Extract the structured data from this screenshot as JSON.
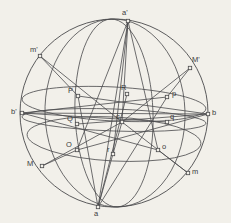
{
  "figure": {
    "background_color": "#f2f0ea",
    "ink_color": "#4a4a4c",
    "label_color": "#3a3a3c",
    "width": 231,
    "height": 223,
    "outer_circle": {
      "cx": 114,
      "cy": 113,
      "r": 94
    },
    "caption_partial": ""
  },
  "points": [
    {
      "id": "a-prime",
      "label": "a'",
      "x": 128,
      "y": 21,
      "lx": 122,
      "ly": 9,
      "marker": true
    },
    {
      "id": "a",
      "label": "a",
      "x": 98,
      "y": 207,
      "lx": 94,
      "ly": 210,
      "marker": true
    },
    {
      "id": "b-prime",
      "label": "b'",
      "x": 22,
      "y": 113,
      "lx": 11,
      "ly": 108,
      "marker": true
    },
    {
      "id": "b",
      "label": "b",
      "x": 208,
      "y": 114,
      "lx": 212,
      "ly": 109,
      "marker": true
    },
    {
      "id": "c",
      "label": "c",
      "x": 122,
      "y": 122,
      "lx": 116,
      "ly": 113,
      "marker": true
    },
    {
      "id": "m-prime",
      "label": "m'",
      "x": 40,
      "y": 56,
      "lx": 30,
      "ly": 46,
      "marker": true
    },
    {
      "id": "M-prime",
      "label": "M'",
      "x": 190,
      "y": 68,
      "lx": 192,
      "ly": 56,
      "marker": true
    },
    {
      "id": "M",
      "label": "M",
      "x": 42,
      "y": 166,
      "lx": 27,
      "ly": 160,
      "marker": true
    },
    {
      "id": "m",
      "label": "m",
      "x": 188,
      "y": 173,
      "lx": 192,
      "ly": 168,
      "marker": true
    },
    {
      "id": "P",
      "label": "P",
      "x": 78,
      "y": 96,
      "lx": 68,
      "ly": 87,
      "marker": true
    },
    {
      "id": "Q",
      "label": "Q",
      "x": 77,
      "y": 124,
      "lx": 67,
      "ly": 115,
      "marker": true
    },
    {
      "id": "O",
      "label": "O",
      "x": 77,
      "y": 150,
      "lx": 66,
      "ly": 141,
      "marker": true
    },
    {
      "id": "R",
      "label": "R",
      "x": 127,
      "y": 94,
      "lx": 121,
      "ly": 84,
      "marker": true
    },
    {
      "id": "r",
      "label": "r",
      "x": 113,
      "y": 154,
      "lx": 107,
      "ly": 146,
      "marker": true
    },
    {
      "id": "p",
      "label": "p",
      "x": 167,
      "y": 97,
      "lx": 172,
      "ly": 90,
      "marker": true
    },
    {
      "id": "q",
      "label": "q",
      "x": 167,
      "y": 122,
      "lx": 170,
      "ly": 113,
      "marker": true
    },
    {
      "id": "o",
      "label": "o",
      "x": 158,
      "y": 150,
      "lx": 162,
      "ly": 143,
      "marker": true
    }
  ],
  "chart_data": {
    "type": "diagram",
    "ellipses": [
      {
        "name": "equator-upper",
        "cx": 114,
        "cy": 104,
        "rx": 92,
        "ry": 17,
        "rot": 3
      },
      {
        "name": "equator-middle",
        "cx": 114,
        "cy": 120,
        "rx": 92,
        "ry": 11,
        "rot": 2
      },
      {
        "name": "equator-lower",
        "cx": 114,
        "cy": 139,
        "rx": 87,
        "ry": 22,
        "rot": 3
      },
      {
        "name": "meridian-left",
        "cx": 114,
        "cy": 113,
        "rx": 39,
        "ry": 94,
        "rot": -2
      },
      {
        "name": "meridian-right",
        "cx": 115,
        "cy": 113,
        "rx": 70,
        "ry": 94,
        "rot": -2
      }
    ],
    "chords": [
      [
        "b-prime",
        "b"
      ],
      [
        "b-prime",
        "p"
      ],
      [
        "b-prime",
        "q"
      ],
      [
        "b-prime",
        "o"
      ],
      [
        "P",
        "b"
      ],
      [
        "Q",
        "b"
      ],
      [
        "O",
        "b"
      ],
      [
        "a-prime",
        "a"
      ],
      [
        "a-prime",
        "c"
      ],
      [
        "a-prime",
        "r"
      ],
      [
        "a-prime",
        "O"
      ],
      [
        "a-prime",
        "o"
      ],
      [
        "a",
        "c"
      ],
      [
        "a",
        "R"
      ],
      [
        "a",
        "P"
      ],
      [
        "a",
        "p"
      ],
      [
        "m-prime",
        "P"
      ],
      [
        "M-prime",
        "p"
      ],
      [
        "M",
        "O"
      ],
      [
        "m",
        "o"
      ],
      [
        "m-prime",
        "c"
      ],
      [
        "m",
        "c"
      ],
      [
        "M",
        "c"
      ],
      [
        "M-prime",
        "c"
      ]
    ]
  }
}
